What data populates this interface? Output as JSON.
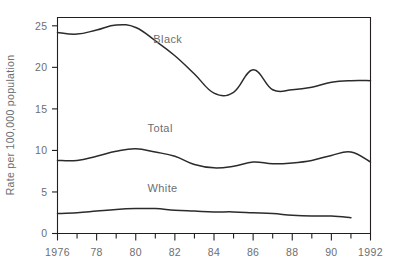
{
  "chart_data": {
    "type": "line",
    "title": "",
    "xlabel": "",
    "ylabel": "Rate per 100,000 population",
    "xlim": [
      1976,
      1992
    ],
    "ylim": [
      0,
      26
    ],
    "grid": false,
    "legend_position": "inline-annotations",
    "y_ticks": [
      0,
      5,
      10,
      15,
      20,
      25
    ],
    "y_tick_labels": [
      "0",
      "5",
      "10",
      "15",
      "20",
      "25"
    ],
    "x_ticks": [
      1976,
      1977,
      1978,
      1979,
      1980,
      1981,
      1982,
      1983,
      1984,
      1985,
      1986,
      1987,
      1988,
      1989,
      1990,
      1991,
      1992
    ],
    "x_tick_labels": [
      "1976",
      "",
      "78",
      "",
      "80",
      "",
      "82",
      "",
      "84",
      "",
      "86",
      "",
      "88",
      "",
      "90",
      "",
      "1992"
    ],
    "x": [
      1976,
      1977,
      1978,
      1979,
      1980,
      1981,
      1982,
      1983,
      1984,
      1985,
      1986,
      1987,
      1988,
      1989,
      1990,
      1991,
      1992
    ],
    "series": [
      {
        "name": "Black",
        "label": "Black",
        "values": [
          24.2,
          24.0,
          24.5,
          25.1,
          24.8,
          23.2,
          21.4,
          19.2,
          16.9,
          17.0,
          19.7,
          17.3,
          17.3,
          17.6,
          18.2,
          18.4,
          18.4
        ]
      },
      {
        "name": "Total",
        "label": "Total",
        "values": [
          8.8,
          8.8,
          9.3,
          9.9,
          10.2,
          9.8,
          9.3,
          8.3,
          7.9,
          8.1,
          8.6,
          8.4,
          8.5,
          8.8,
          9.4,
          9.8,
          8.6
        ]
      },
      {
        "name": "White",
        "label": "White",
        "values": [
          2.4,
          2.5,
          2.7,
          2.9,
          3.0,
          3.0,
          2.8,
          2.7,
          2.6,
          2.6,
          2.5,
          2.4,
          2.2,
          2.1,
          2.1,
          1.9,
          null
        ]
      }
    ],
    "annotations": [
      {
        "text": "Black",
        "series": "Black",
        "x": 1980.9,
        "y": 22.9
      },
      {
        "text": "Total",
        "series": "Total",
        "x": 1980.6,
        "y": 12.2
      },
      {
        "text": "White",
        "series": "White",
        "x": 1980.6,
        "y": 5.0
      }
    ],
    "colors": {
      "line": "#2b2b2b",
      "axis": "#231f20",
      "text": "#6d6e70",
      "background": "#ffffff"
    }
  }
}
